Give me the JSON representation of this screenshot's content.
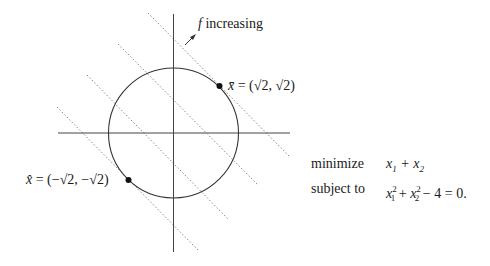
{
  "diagram": {
    "type": "constrained-optimization-illustration",
    "axes": {
      "horizontal": true,
      "vertical": true
    },
    "circle": {
      "label": "constraint x1^2 + x2^2 = 4",
      "radius": 2
    },
    "level_lines": {
      "count": 4,
      "style": "dotted",
      "direction": "x1 + x2 = const"
    },
    "arrow_label": {
      "symbol": "f",
      "text": "increasing"
    },
    "points": [
      {
        "name": "x-bar",
        "symbol": "x̄",
        "value": "(√2, √2)",
        "display": "= (√2, √2)"
      },
      {
        "name": "x-hat",
        "symbol": "x̂",
        "value": "(−√2, −√2)",
        "display": "= (−√2, −√2)"
      }
    ]
  },
  "problem": {
    "objective_keyword": "minimize",
    "objective": "x1 + x2",
    "constraint_keyword": "subject to",
    "constraint": "x1^2 + x2^2 − 4 = 0."
  },
  "colors": {
    "lines": "#333333",
    "dotted": "#888888",
    "background": "#ffffff"
  }
}
